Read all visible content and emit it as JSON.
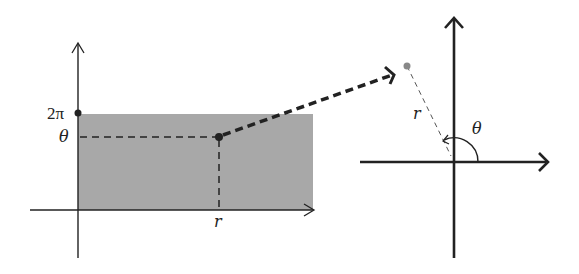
{
  "diagram": {
    "left_panel": {
      "y_axis_label_top": "2π",
      "y_axis_label_theta": "θ",
      "x_axis_label": "r",
      "region_fill": "#a8a8a8",
      "region": {
        "r_from": 0,
        "theta_from": 0,
        "theta_to": "2π"
      }
    },
    "mapping_arrow": {
      "style": "thick-dashed",
      "from": "(r, θ) point",
      "to": "polar point"
    },
    "right_panel": {
      "radius_label": "r",
      "angle_label": "θ",
      "point_color": "#888888"
    },
    "colors": {
      "stroke": "#222222",
      "fill_region": "#a8a8a8"
    }
  }
}
